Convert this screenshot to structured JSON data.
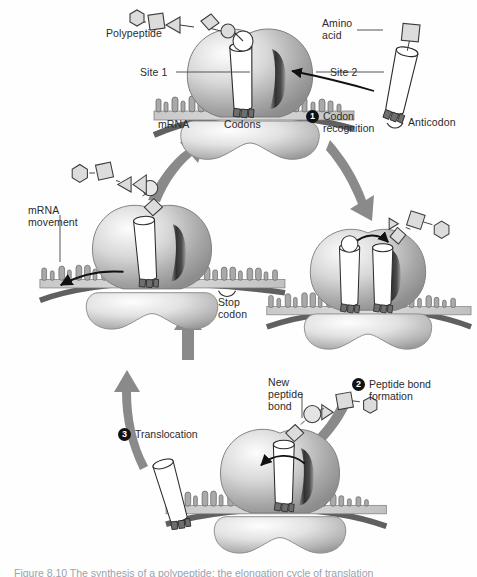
{
  "figure": {
    "caption": "Figure 8.10  The synthesis of a polypeptide: the elongation cycle of translation",
    "background_color": "#fefefe",
    "ink_color": "#2b2b2b",
    "arrow_color": "#8a8a8a",
    "badge_color": "#111111"
  },
  "labels": {
    "polypeptide": "Polypeptide",
    "amino_acid": "Amino\nacid",
    "site1": "Site 1",
    "site2": "Site 2",
    "mrna": "mRNA",
    "codons": "Codons",
    "anticodon": "Anticodon",
    "mrna_movement": "mRNA\nmovement",
    "stop_codon": "Stop\ncodon",
    "new_peptide_bond": "New\npeptide\nbond"
  },
  "steps": [
    {
      "number": "1",
      "text": "Codon\nrecognition"
    },
    {
      "number": "2",
      "text": "Peptide bond\nformation"
    },
    {
      "number": "3",
      "text": "Translocation"
    }
  ],
  "ribosomes": [
    {
      "name": "top-ribosome",
      "stage": "codon recognition"
    },
    {
      "name": "right-ribosome",
      "stage": "peptide bond formation"
    },
    {
      "name": "bottom-ribosome",
      "stage": "translocation"
    },
    {
      "name": "left-ribosome",
      "stage": "mRNA movement / stop codon"
    }
  ],
  "molecules": {
    "trna_incoming": "tRNA carrying amino acid",
    "trna_leaving": "empty tRNA released",
    "polypeptide_chain": "chain of amino acid residues"
  }
}
